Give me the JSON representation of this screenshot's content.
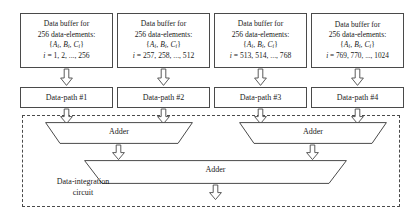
{
  "diagram": {
    "stroke_color": "#4a4a4a",
    "fill_color": "#ffffff",
    "text_color": "#1a1a1a"
  },
  "buffers": [
    {
      "id": "buffer-1",
      "line1": "Data buffer for",
      "line2": "256 data-elements:",
      "set_open": "{",
      "set_a": "A",
      "set_a_sub": "i",
      "set_sep1": ", ",
      "set_b": "B",
      "set_b_sub": "i",
      "set_sep2": ", ",
      "set_c": "C",
      "set_c_sub": "i",
      "set_close": "}",
      "index_var": "i",
      "index_range": "= 1, 2, ..., 256"
    },
    {
      "id": "buffer-2",
      "line1": "Data buffer for",
      "line2": "256 data-elements:",
      "set_open": "{",
      "set_a": "A",
      "set_a_sub": "i",
      "set_sep1": ", ",
      "set_b": "B",
      "set_b_sub": "i",
      "set_sep2": ", ",
      "set_c": "C",
      "set_c_sub": "i",
      "set_close": "}",
      "index_var": "i",
      "index_range": "= 257, 258, ..., 512"
    },
    {
      "id": "buffer-3",
      "line1": "Data buffer for",
      "line2": "256 data-elements:",
      "set_open": "{",
      "set_a": "A",
      "set_a_sub": "i",
      "set_sep1": ", ",
      "set_b": "B",
      "set_b_sub": "i",
      "set_sep2": ", ",
      "set_c": "C",
      "set_c_sub": "i",
      "set_close": "}",
      "index_var": "i",
      "index_range": "= 513, 514, ..., 768"
    },
    {
      "id": "buffer-4",
      "line1": "Data buffer for",
      "line2": "256 data-elements:",
      "set_open": "{",
      "set_a": "A",
      "set_a_sub": "i",
      "set_sep1": ", ",
      "set_b": "B",
      "set_b_sub": "i",
      "set_sep2": ", ",
      "set_c": "C",
      "set_c_sub": "i",
      "set_close": "}",
      "index_var": "i",
      "index_range": "= 769, 770, ..., 1024"
    }
  ],
  "datapaths": [
    {
      "id": "datapath-1",
      "label": "Data-path #1"
    },
    {
      "id": "datapath-2",
      "label": "Data-path #2"
    },
    {
      "id": "datapath-3",
      "label": "Data-path #3"
    },
    {
      "id": "datapath-4",
      "label": "Data-path #4"
    }
  ],
  "integration": {
    "label_line1": "Data-integration",
    "label_line2": "circuit",
    "adders": [
      {
        "id": "adder-left",
        "label": "Adder"
      },
      {
        "id": "adder-right",
        "label": "Adder"
      },
      {
        "id": "adder-bottom",
        "label": "Adder"
      }
    ]
  },
  "arrows": {
    "icon": "down-block-arrow",
    "count": 11
  }
}
